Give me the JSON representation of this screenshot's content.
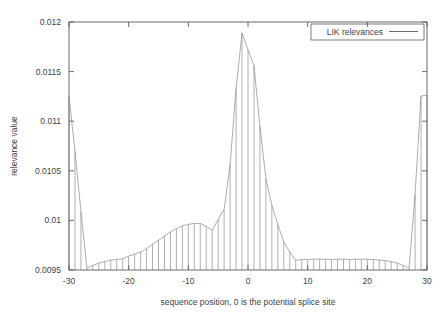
{
  "chart_data": {
    "type": "bar",
    "title": "",
    "subtitle": "",
    "xlabel": "sequence position, 0 is the potential splice site",
    "ylabel": "relevance value",
    "xlim": [
      -30,
      30
    ],
    "ylim": [
      0.0095,
      0.012
    ],
    "grid": false,
    "legend_position": "top-right",
    "xticks": [
      -30,
      -20,
      -10,
      0,
      10,
      20,
      30
    ],
    "xtick_labels": [
      "-30",
      "-20",
      "-10",
      "0",
      "10",
      "20",
      "30"
    ],
    "yticks": [
      0.0095,
      0.01,
      0.0105,
      0.011,
      0.0115,
      0.012
    ],
    "ytick_labels": [
      "0.0095",
      "0.01",
      "0.0105",
      "0.011",
      "0.0115",
      "0.012"
    ],
    "style": "impulses-with-outline",
    "series": [
      {
        "name": "LIK relevances",
        "x": [
          -30,
          -29,
          -28,
          -27,
          -26,
          -25,
          -24,
          -23,
          -22,
          -21,
          -20,
          -19,
          -18,
          -17,
          -16,
          -15,
          -14,
          -13,
          -12,
          -11,
          -10,
          -9,
          -8,
          -7,
          -6,
          -5,
          -4,
          -3,
          -2,
          -1,
          0,
          1,
          2,
          3,
          4,
          5,
          6,
          7,
          8,
          9,
          10,
          11,
          12,
          13,
          14,
          15,
          16,
          17,
          18,
          19,
          20,
          21,
          22,
          23,
          24,
          25,
          26,
          27,
          28,
          29,
          30
        ],
        "values": [
          0.01125,
          0.0107,
          0.01009,
          0.00952,
          0.009545,
          0.00957,
          0.009585,
          0.0096,
          0.009605,
          0.009615,
          0.00964,
          0.00966,
          0.00968,
          0.009715,
          0.00976,
          0.0098,
          0.00984,
          0.009885,
          0.009915,
          0.009945,
          0.00996,
          0.009968,
          0.00997,
          0.00994,
          0.0099,
          0.01001,
          0.01011,
          0.01056,
          0.01133,
          0.01189,
          0.01172,
          0.01156,
          0.01095,
          0.01042,
          0.01015,
          0.00996,
          0.00978,
          0.00968,
          0.0096,
          0.009605,
          0.009605,
          0.00961,
          0.00961,
          0.009608,
          0.009606,
          0.009608,
          0.00961,
          0.009605,
          0.009608,
          0.00961,
          0.009608,
          0.009605,
          0.0096,
          0.009595,
          0.009585,
          0.00957,
          0.009545,
          0.00952,
          0.01026,
          0.011255,
          0.01126
        ]
      }
    ]
  },
  "legend": {
    "entries": [
      {
        "label": "LIK relevances",
        "marker": "line"
      }
    ]
  },
  "axes": {
    "x_title": "sequence position, 0 is the potential splice site",
    "y_title": "relevance value"
  }
}
